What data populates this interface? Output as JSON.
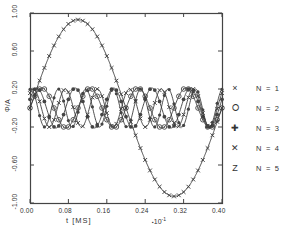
{
  "chart_data": {
    "type": "line",
    "title": "",
    "xlabel": "t [MS]",
    "ylabel": "Φ/A",
    "x_exponent_note": "∂10⁻¹",
    "x_exponent_symbol": "▪",
    "x_exponent_base": "10",
    "x_exponent_power": "-1",
    "xlim": [
      0.0,
      0.4
    ],
    "ylim": [
      -1.0,
      1.0
    ],
    "xticks": [
      "0.00",
      "0.08",
      "0.16",
      "0.24",
      "0.32",
      "0.40"
    ],
    "xtick_values": [
      0.0,
      0.08,
      0.16,
      0.24,
      0.32,
      0.4
    ],
    "yticks": [
      "1.00",
      "0.60",
      "0.20",
      "-0.20",
      "-0.60",
      "-1.00"
    ],
    "ytick_values": [
      1.0,
      0.6,
      0.2,
      -0.2,
      -0.6,
      -1.0
    ],
    "grid": false,
    "legend_position": "right-outside",
    "series": [
      {
        "name": "N = 1",
        "marker": "×",
        "marker_name": "cross-x-marker",
        "amplitude": 0.93,
        "cycles": 1.0,
        "phase": 0.0,
        "color": "#333333"
      },
      {
        "name": "N = 2",
        "marker": "⭘",
        "marker_name": "circle-dot-marker",
        "amplitude": 0.21,
        "cycles": 4.0,
        "phase": 0.0,
        "color": "#333333"
      },
      {
        "name": "N = 3",
        "marker": "✚",
        "marker_name": "plus-star-marker",
        "amplitude": 0.21,
        "cycles": 5.0,
        "phase": 0.45,
        "color": "#333333"
      },
      {
        "name": "N = 4",
        "marker": "✕",
        "marker_name": "x-bold-marker",
        "amplitude": 0.2,
        "cycles": 6.0,
        "phase": 0.9,
        "color": "#333333"
      },
      {
        "name": "N = 5",
        "marker": "Z",
        "marker_name": "z-letter-marker",
        "amplitude": 0.2,
        "cycles": 7.0,
        "phase": 1.35,
        "color": "#333333"
      }
    ]
  },
  "figure": {
    "frame_color": "#444444",
    "background": "#ffffff"
  }
}
